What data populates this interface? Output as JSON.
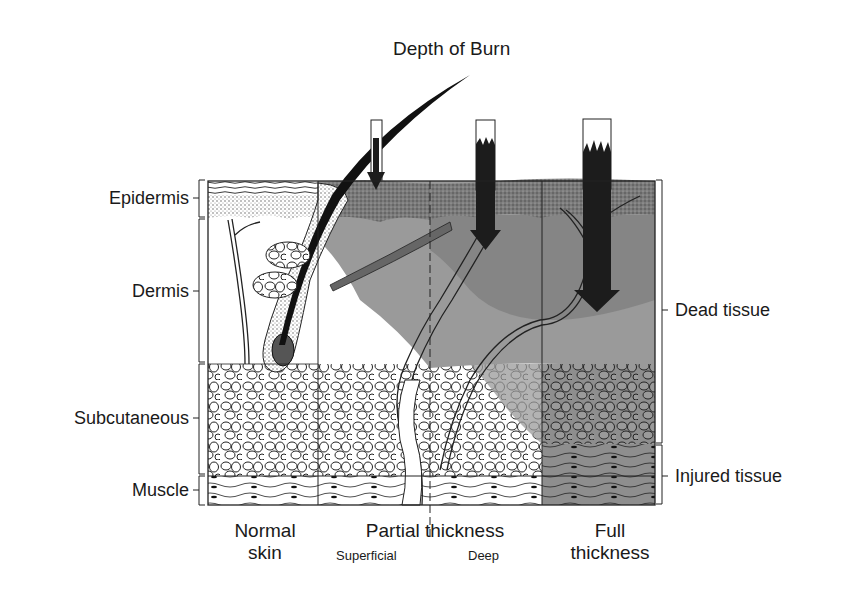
{
  "title": "Depth of Burn",
  "layers": [
    {
      "label": "Epidermis",
      "y_top": 180,
      "y_bottom": 217
    },
    {
      "label": "Dermis",
      "y_top": 218,
      "y_bottom": 362
    },
    {
      "label": "Subcutaneous",
      "y_top": 364,
      "y_bottom": 474
    },
    {
      "label": "Muscle",
      "y_top": 476,
      "y_bottom": 505
    }
  ],
  "zones": [
    {
      "label": "Dead tissue",
      "y_top": 180,
      "y_bottom": 443
    },
    {
      "label": "Injured tissue",
      "y_top": 445,
      "y_bottom": 504
    }
  ],
  "columns": {
    "normal": {
      "line1": "Normal",
      "line2": "skin"
    },
    "partial": {
      "label": "Partial thickness",
      "superficial": "Superficial",
      "deep": "Deep"
    },
    "full": {
      "line1": "Full",
      "line2": "thickness"
    }
  },
  "colors": {
    "ink": "#1a1a1a",
    "dead_tissue": "#8c8c8c",
    "epidermis_dead": "#777777",
    "injured_tissue": "#9a9a9a",
    "arrow": "#1c1c1c"
  }
}
